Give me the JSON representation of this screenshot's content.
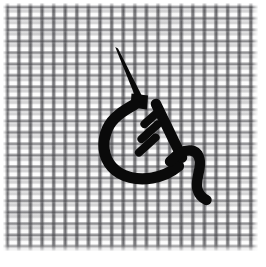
{
  "image": {
    "title": "Embroidery needle and thread on woven mesh fabric",
    "width": 266,
    "height": 267,
    "background_color": "#ffffff"
  },
  "fabric": {
    "name": "woven mesh fabric",
    "thread_color": "#6e6e72",
    "base_color": "#fdfdfd",
    "weave_pitch_px": 11.5,
    "bounds": {
      "x": 3,
      "y": 3,
      "width": 255,
      "height": 248
    }
  },
  "drawing": {
    "ink_color": "#0a0a0a",
    "subject": "sewing needle with thread forming a loop and running stitches",
    "parts": [
      {
        "name": "needle-shaft",
        "description": "thin tapered diagonal line from upper-left to lower-right",
        "from": [
          116,
          48
        ],
        "to": [
          139,
          97
        ]
      },
      {
        "name": "needle-eye-knot",
        "description": "solid black square where needle meets thread",
        "x": 132,
        "y": 94,
        "width": 16,
        "height": 14
      },
      {
        "name": "thread-loop",
        "description": "thick black arc curving left and down then right",
        "from": [
          133,
          106
        ],
        "to": [
          178,
          172
        ]
      },
      {
        "name": "thread-diagonal",
        "description": "thick straight stroke descending to the right",
        "from": [
          156,
          104
        ],
        "to": [
          181,
          156
        ]
      },
      {
        "name": "stitch-dash-1",
        "description": "short diagonal running stitch",
        "from": [
          158,
          110
        ],
        "to": [
          143,
          124
        ]
      },
      {
        "name": "stitch-dash-2",
        "description": "short diagonal running stitch",
        "from": [
          157,
          123
        ],
        "to": [
          140,
          139
        ]
      },
      {
        "name": "stitch-dash-3",
        "description": "short diagonal running stitch",
        "from": [
          155,
          136
        ],
        "to": [
          138,
          152
        ]
      },
      {
        "name": "thread-tail",
        "description": "S-curved loose thread end hanging down to the right",
        "from": [
          172,
          155
        ],
        "to": [
          207,
          200
        ]
      }
    ]
  }
}
